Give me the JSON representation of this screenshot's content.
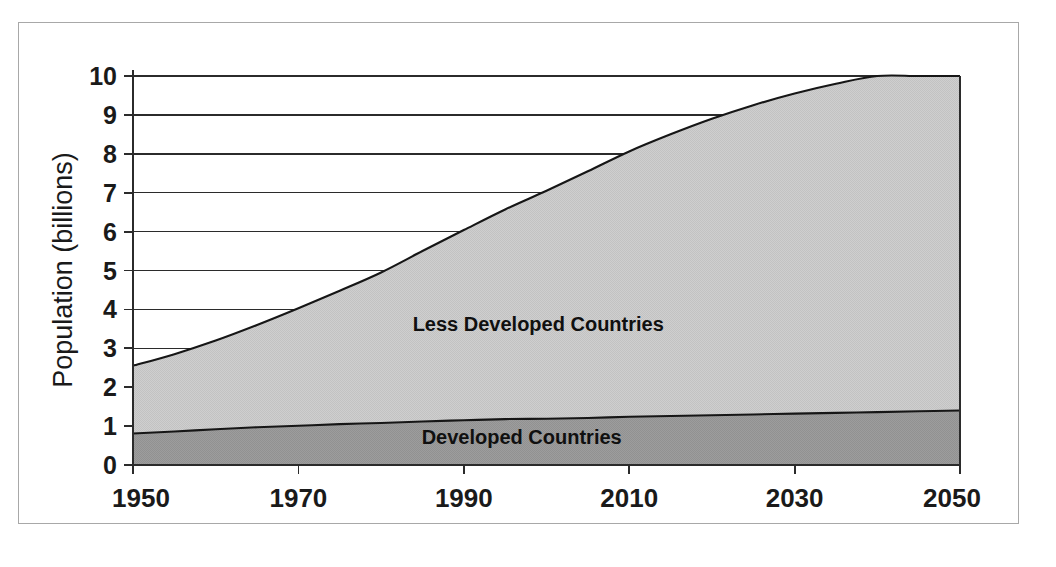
{
  "figure": {
    "background_color": "#ffffff",
    "frame_color": "#a8a8a8"
  },
  "chart_data": {
    "type": "area",
    "stacked": true,
    "title": "",
    "xlabel": "",
    "ylabel": "Population (billions)",
    "xlim": [
      1950,
      2050
    ],
    "ylim": [
      0,
      10
    ],
    "grid": true,
    "grid_axis": "y",
    "legend_position": "inline-annotations",
    "x_tick_labels": [
      "1950",
      "1970",
      "1990",
      "2010",
      "2030",
      "2050"
    ],
    "x_ticks": [
      1950,
      1970,
      1990,
      2010,
      2030,
      2050
    ],
    "y_tick_labels": [
      "0",
      "1",
      "2",
      "3",
      "4",
      "5",
      "6",
      "7",
      "8",
      "9",
      "10"
    ],
    "y_ticks": [
      0,
      1,
      2,
      3,
      4,
      5,
      6,
      7,
      8,
      9,
      10
    ],
    "x": [
      1950,
      1955,
      1960,
      1965,
      1970,
      1975,
      1980,
      1985,
      1990,
      1995,
      2000,
      2005,
      2010,
      2015,
      2020,
      2025,
      2030,
      2035,
      2040,
      2045,
      2050
    ],
    "series": [
      {
        "name": "Developed Countries",
        "color": "#9a9a9a",
        "label_text": "Developed Countries",
        "label_x": 1997,
        "label_y": 0.55,
        "values": [
          0.81,
          0.86,
          0.92,
          0.97,
          1.01,
          1.05,
          1.08,
          1.12,
          1.15,
          1.18,
          1.19,
          1.21,
          1.24,
          1.26,
          1.28,
          1.3,
          1.32,
          1.34,
          1.36,
          1.38,
          1.4
        ]
      },
      {
        "name": "Less Developed Countries",
        "color": "#cbcbcb",
        "label_text": "Less Developed Countries",
        "label_x": 1999,
        "label_y": 3.45,
        "values": [
          1.74,
          1.99,
          2.28,
          2.63,
          3.02,
          3.43,
          3.87,
          4.38,
          4.89,
          5.39,
          5.86,
          6.34,
          6.82,
          7.24,
          7.62,
          7.95,
          8.23,
          8.46,
          8.65,
          8.8,
          9.15
        ]
      }
    ],
    "totals": [
      2.55,
      2.85,
      3.2,
      3.6,
      4.03,
      4.48,
      4.95,
      5.5,
      6.04,
      6.57,
      7.05,
      7.55,
      8.06,
      8.5,
      8.9,
      9.25,
      9.55,
      9.8,
      10.01,
      10.18,
      10.55
    ],
    "total_stacked_top": [
      2.55,
      2.85,
      3.2,
      3.6,
      4.03,
      4.48,
      4.95,
      5.5,
      6.04,
      6.57,
      7.05,
      7.55,
      8.06,
      8.5,
      8.9,
      9.25,
      9.55,
      9.8,
      10.01,
      10.18,
      10.55
    ]
  }
}
